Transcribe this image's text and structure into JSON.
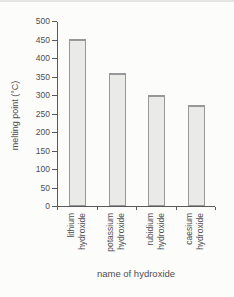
{
  "figure": {
    "background": "#fcfcfa"
  },
  "chart_data": {
    "type": "bar",
    "title": "",
    "categories": [
      "lithium hydroxide",
      "potassium hydroxide",
      "rubidium hydroxide",
      "caesium hydroxide"
    ],
    "values": [
      450,
      360,
      300,
      272
    ],
    "xlabel": "name of hydroxide",
    "ylabel": "melting point (°C)",
    "ylim": [
      0,
      500
    ],
    "yticks": [
      0,
      50,
      100,
      150,
      200,
      250,
      300,
      350,
      400,
      450,
      500
    ],
    "grid": false,
    "legend": false,
    "bar_fill": "#eaeae8",
    "bar_border": "#98989a",
    "axis_color": "#59595c",
    "text_color": "#4e4e52"
  }
}
